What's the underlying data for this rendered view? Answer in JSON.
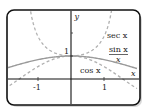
{
  "chart_data": {
    "type": "line",
    "title": "",
    "xlabel": "x",
    "ylabel": "y",
    "xlim": [
      -2.0,
      2.0
    ],
    "ylim": [
      -1.0,
      3.2
    ],
    "x_ticks": [
      {
        "value": -1,
        "label": "-1"
      },
      {
        "value": 1,
        "label": "1"
      }
    ],
    "y_ticks": [
      {
        "value": 1,
        "label": "1"
      },
      {
        "value": 2,
        "label": ""
      }
    ],
    "grid": false,
    "series": [
      {
        "name": "sec x",
        "label": "sec x",
        "function": "1/cos(x)",
        "style": "dashed",
        "color": "#aaaaaa",
        "domain": [
          -1.25,
          1.25
        ]
      },
      {
        "name": "cos x",
        "label": "cos x",
        "function": "cos(x)",
        "style": "dashed",
        "color": "#aaaaaa",
        "domain": [
          -2.0,
          2.0
        ]
      },
      {
        "name": "sin x / x",
        "label_numerator": "sin x",
        "label_denominator": "x",
        "function": "sin(x)/x",
        "style": "solid",
        "color": "#999999",
        "domain": [
          -2.0,
          2.0
        ]
      }
    ],
    "annotations": [
      {
        "text": "sec x",
        "near_series": "sec x"
      },
      {
        "text": "sin x / x",
        "near_series": "sin x / x"
      },
      {
        "text": "cos x",
        "near_series": "cos x"
      }
    ]
  },
  "labels": {
    "y_axis": "y",
    "x_axis": "x",
    "y_one": "1",
    "tick_neg1": "-1",
    "tick_pos1": "1",
    "sec": "sec x",
    "sinc_num": "sin x",
    "sinc_den": "x",
    "cos": "cos x"
  },
  "colors": {
    "frame": "#111111",
    "axis": "#111111",
    "curve_solid": "#9a9a9a",
    "curve_dashed": "#b0b0b0",
    "shadow": "#9a9a9a"
  }
}
